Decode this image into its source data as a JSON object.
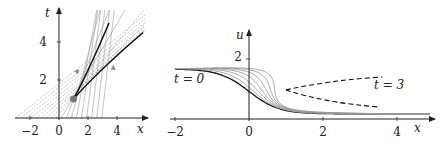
{
  "left_panel": {
    "axis_x_label": "x",
    "axis_y_label": "t",
    "x_ticks": [
      {
        "v": -2,
        "label": "−2"
      },
      {
        "v": 0,
        "label": "0"
      },
      {
        "v": 2,
        "label": "2"
      },
      {
        "v": 4,
        "label": "4"
      }
    ],
    "y_ticks": [
      {
        "v": 2,
        "label": "2"
      },
      {
        "v": 4,
        "label": "4"
      }
    ],
    "origin_px": [
      59,
      118
    ],
    "scale_px": [
      14.5,
      19
    ],
    "dot": {
      "x": 1,
      "t": 1
    },
    "colors": {
      "characteristics": "#9a9a9a",
      "envelope": "#111111",
      "dot": "#777777",
      "axis": "#222222"
    }
  },
  "right_panel": {
    "axis_x_label": "x",
    "axis_y_label": "u",
    "x_ticks": [
      {
        "v": -2,
        "label": "−2"
      },
      {
        "v": 0,
        "label": "0"
      },
      {
        "v": 2,
        "label": "2"
      },
      {
        "v": 4,
        "label": "4"
      }
    ],
    "y_ticks": [
      {
        "v": 2,
        "label": "2"
      }
    ],
    "origin_px": [
      249,
      119
    ],
    "scale_px": [
      37,
      30
    ],
    "label_t0": "t = 0",
    "label_t3": "t = 3",
    "times": [
      0,
      0.5,
      1,
      1.5,
      2,
      2.5,
      3
    ],
    "colors": {
      "t0": "#111111",
      "later": "#9a9a9a",
      "fold": "#111111",
      "axis": "#222222"
    }
  },
  "chart_data": [
    {
      "type": "line",
      "title": "Characteristics in the (x,t) plane",
      "xlabel": "x",
      "ylabel": "t",
      "xlim": [
        -3,
        5
      ],
      "ylim": [
        0,
        5.5
      ],
      "annotations": [
        "shock-forming envelope starting at (1,1)",
        "crossing characteristic lines with direction arrows"
      ],
      "envelope_branches": [
        {
          "name": "steep branch",
          "points": [
            [
              1,
              1
            ],
            [
              2,
              2.5
            ],
            [
              3.4,
              5
            ]
          ]
        },
        {
          "name": "shallow branch",
          "points": [
            [
              1,
              1
            ],
            [
              2.6,
              2.3
            ],
            [
              5.8,
              4.5
            ]
          ]
        }
      ]
    },
    {
      "type": "line",
      "title": "Solution profiles u(x,t)",
      "xlabel": "x",
      "ylabel": "u",
      "xlim": [
        -2,
        5
      ],
      "ylim": [
        0,
        2.5
      ],
      "series_labels": [
        "t = 0",
        "t = 3"
      ],
      "legend": "inline labels",
      "initial_profile": {
        "x": [
          -2,
          -1,
          0,
          1,
          2,
          3,
          4
        ],
        "u": [
          1.63,
          1.5,
          0.95,
          0.45,
          0.27,
          0.2,
          0.16
        ]
      },
      "fold_curve": {
        "cusp": [
          1.0,
          0.97
        ],
        "upper_end": [
          3.6,
          1.4
        ],
        "lower_end": [
          3.5,
          0.4
        ]
      }
    }
  ]
}
